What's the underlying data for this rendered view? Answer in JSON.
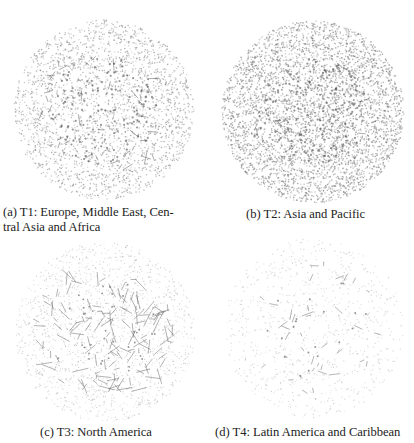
{
  "figure": {
    "subfigures": [
      {
        "id": "a",
        "label": "(a)",
        "caption_line1": "T1: Europe, Middle East, Cen-",
        "caption_line2": "tral Asia and Africa",
        "region": "Europe, Middle East, Central Asia and Africa",
        "tier": "T1",
        "circle": {
          "cx": 104,
          "cy": 110,
          "r": 90
        },
        "texture": {
          "dots": 2600,
          "dot_color": "#8a8a8a",
          "dot_opacity": 0.55,
          "dot_r": 0.75,
          "edges": 45,
          "edge_len": 9,
          "edge_color": "#555555",
          "dark_dots": 140,
          "seed": 11
        }
      },
      {
        "id": "b",
        "label": "(b)",
        "caption_line1": "T2: Asia and Pacific",
        "caption_line2": "",
        "region": "Asia and Pacific",
        "tier": "T2",
        "circle": {
          "cx": 313,
          "cy": 112,
          "r": 91
        },
        "texture": {
          "dots": 4200,
          "dot_color": "#7a7a7a",
          "dot_opacity": 0.55,
          "dot_r": 0.8,
          "edges": 25,
          "edge_len": 6,
          "edge_color": "#555555",
          "dark_dots": 160,
          "seed": 23
        }
      },
      {
        "id": "c",
        "label": "(c)",
        "caption_line1": "T3: North America",
        "caption_line2": "",
        "region": "North America",
        "tier": "T3",
        "circle": {
          "cx": 105,
          "cy": 332,
          "r": 90
        },
        "texture": {
          "dots": 1700,
          "dot_color": "#9a9a9a",
          "dot_opacity": 0.45,
          "dot_r": 0.6,
          "edges": 140,
          "edge_len": 12,
          "edge_color": "#666666",
          "dark_dots": 40,
          "seed": 37
        }
      },
      {
        "id": "d",
        "label": "(d)",
        "caption_line1": "T4: Latin America and Caribbean",
        "caption_line2": "",
        "region": "Latin America and Caribbean",
        "tier": "T4",
        "circle": {
          "cx": 314,
          "cy": 328,
          "r": 90
        },
        "texture": {
          "dots": 900,
          "dot_color": "#a8a8a8",
          "dot_opacity": 0.45,
          "dot_r": 0.65,
          "edges": 38,
          "edge_len": 9,
          "edge_color": "#6a6a6a",
          "dark_dots": 20,
          "seed": 53
        }
      }
    ]
  }
}
